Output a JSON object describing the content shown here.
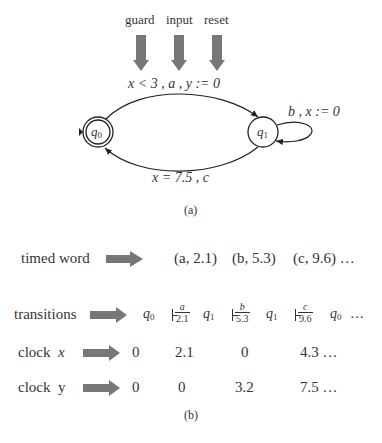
{
  "part_a": {
    "annotations": [
      "guard",
      "input",
      "reset"
    ],
    "states": [
      {
        "id": "q0",
        "base": "q",
        "sub": "0",
        "initial": true,
        "accepting": true
      },
      {
        "id": "q1",
        "base": "q",
        "sub": "1",
        "initial": false,
        "accepting": false
      }
    ],
    "edges": {
      "q0_to_q1": {
        "guard": "x < 3",
        "input": "a",
        "reset": "y := 0",
        "label": "x < 3 ,  a  ,  y := 0"
      },
      "q1_self": {
        "input": "b",
        "reset": "x := 0",
        "label": "b  ,  x := 0"
      },
      "q1_to_q0": {
        "guard": "x = 7.5",
        "input": "c",
        "label": "x = 7.5 ,  c"
      }
    },
    "caption": "(a)"
  },
  "part_b": {
    "timed_word": {
      "label": "timed word",
      "items": [
        "(a, 2.1)",
        "(b, 5.3)",
        "(c, 9.6) …"
      ]
    },
    "transitions": {
      "label": "transitions",
      "states": [
        "q0",
        "q1",
        "q1",
        "q0"
      ],
      "steps": [
        {
          "symbol": "a",
          "time": "2.1"
        },
        {
          "symbol": "b",
          "time": "5.3"
        },
        {
          "symbol": "c",
          "time": "9.6"
        }
      ],
      "ellipsis": "…"
    },
    "clock_x": {
      "label_prefix": "clock",
      "label_var": "x",
      "values": [
        "0",
        "2.1",
        "0",
        "4.3 …"
      ]
    },
    "clock_y": {
      "label_prefix": "clock",
      "label_var": "y",
      "values": [
        "0",
        "0",
        "3.2",
        "7.5 …"
      ]
    },
    "caption": "(b)"
  },
  "colors": {
    "arrow_fill": "#777777",
    "ink": "#333333"
  }
}
